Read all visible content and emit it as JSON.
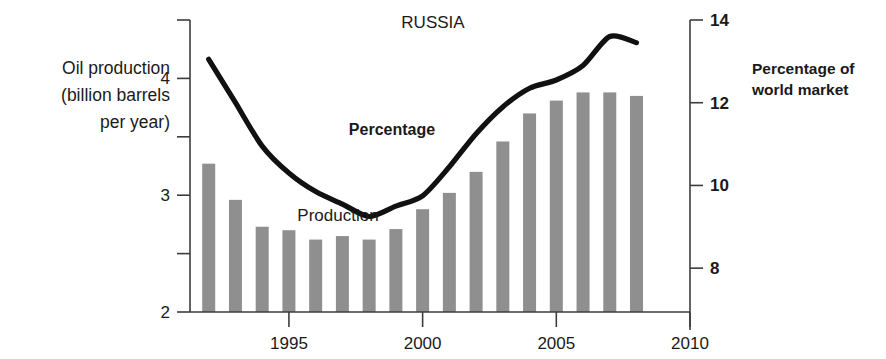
{
  "chart_data": {
    "type": "bar",
    "title": "RUSSIA",
    "xlabel": "",
    "ylabel": "Oil production (billion barrels per year)",
    "y2label": "Percentage of world market",
    "grid": false,
    "legend_position": "inline-annotations",
    "x": [
      1992,
      1993,
      1994,
      1995,
      1996,
      1997,
      1998,
      1999,
      2000,
      2001,
      2002,
      2003,
      2004,
      2005,
      2006,
      2007,
      2008
    ],
    "xlim": [
      1991.3,
      2010
    ],
    "xticks": [
      "1995",
      "2000",
      "2005",
      "2010"
    ],
    "xtick_values": [
      1995,
      2000,
      2005,
      2010
    ],
    "ylim": [
      2,
      4.5
    ],
    "yticks": [
      "2",
      "3",
      "4"
    ],
    "ytick_values": [
      2,
      3,
      4
    ],
    "yminor_values": [
      2.5,
      3.5,
      4.5
    ],
    "y2lim": [
      6.94,
      14
    ],
    "y2ticks": [
      "8",
      "10",
      "12",
      "14"
    ],
    "y2tick_values": [
      8,
      10,
      12,
      14
    ],
    "series": [
      {
        "name": "Production",
        "type": "bar",
        "axis": "left",
        "units": "billion barrels per year",
        "color": "#8f8f8f",
        "values": [
          3.27,
          2.96,
          2.73,
          2.7,
          2.62,
          2.65,
          2.62,
          2.71,
          2.88,
          3.02,
          3.2,
          3.46,
          3.7,
          3.81,
          3.88,
          3.88,
          3.85
        ]
      },
      {
        "name": "Percentage",
        "type": "line",
        "axis": "right",
        "units": "percent of world market",
        "color": "#111111",
        "values": [
          13.05,
          12.0,
          10.95,
          10.3,
          9.85,
          9.55,
          9.25,
          9.5,
          9.75,
          10.45,
          11.25,
          11.9,
          12.35,
          12.55,
          12.9,
          13.6,
          13.45
        ]
      }
    ],
    "annotations": [
      {
        "name": "percentage-label",
        "text": "Percentage",
        "x": 2000.3,
        "y2": 11.6
      },
      {
        "name": "production-label",
        "text": "Production",
        "x": 1996.3,
        "y": 2.97
      }
    ]
  },
  "labels": {
    "title": "RUSSIA",
    "left_axis_line1": "Oil production",
    "left_axis_line2": "(billion barrels",
    "left_axis_line3": "per year)",
    "right_axis_line1": "Percentage of",
    "right_axis_line2": "world market",
    "percentage_annotation": "Percentage",
    "production_annotation": "Production"
  }
}
